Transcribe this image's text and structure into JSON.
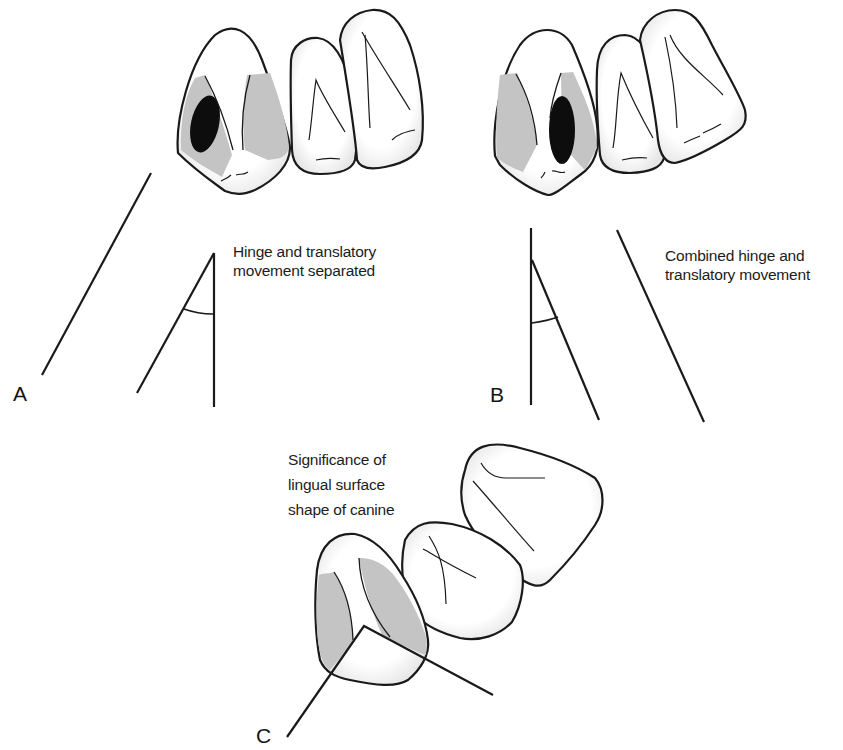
{
  "figure": {
    "panels": [
      {
        "id": "A",
        "label": "A",
        "caption_lines": [
          "Hinge and translatory",
          "movement separated"
        ]
      },
      {
        "id": "B",
        "label": "B",
        "caption_lines": [
          "Combined hinge and",
          "translatory movement"
        ]
      },
      {
        "id": "C",
        "label": "C",
        "caption_lines": [
          "Significance of",
          "lingual surface",
          "shape of canine"
        ]
      }
    ],
    "colors": {
      "outline": "#1a1a1a",
      "tooth_fill": "#ffffff",
      "facet_gray": "#c4c4c4",
      "contact_black": "#0d0d0d",
      "background": "#ffffff"
    }
  }
}
